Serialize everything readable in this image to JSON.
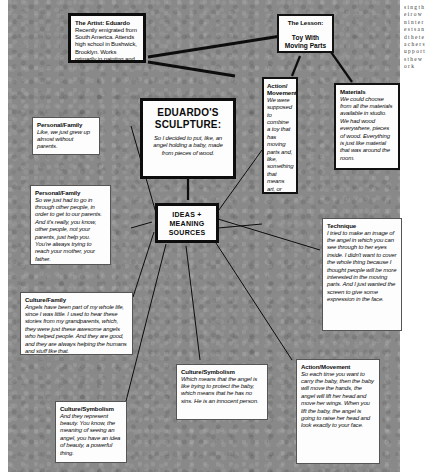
{
  "poster": {
    "background_color": "#898989",
    "node_fill": "#fdfdfd",
    "ink_color": "#0b0b0b"
  },
  "nodes": {
    "artist": {
      "header": "The Artist: Eduardo",
      "body": "Recently emigrated from South America. Attends high school in Bushwick, Brooklyn. Works primarily in painting and drawing, and much of his work is published in the student literary magazine."
    },
    "lesson": {
      "header": "The Lesson:",
      "subtitle": "Toy With Moving Parts"
    },
    "sculpture": {
      "title": "EDUARDO'S SCULPTURE:",
      "body": "So I decided to put, like, an angel holding a baby, made from pieces of wood."
    },
    "ideas": {
      "title": "IDEAS + MEANING SOURCES"
    },
    "action_top": {
      "header": "Action/ Movement",
      "body": "We were supposed to combine a toy that has moving parts and, like, something that means art, or means something to you."
    },
    "materials": {
      "header": "Materials",
      "body": "We could choose from all the materials available in studio. We had wood everywhere, pieces of wood. Everything is just like material that was around the room."
    },
    "technique": {
      "header": "Technique",
      "body": "I tried to make an image of the angel in which you can see through to her eyes inside. I didn't want to cover the whole thing because I thought people will be more interested in the moving parts. And I just wanted the screen to give some expression in the face."
    },
    "personal_family_1": {
      "header": "Personal/Family",
      "body": "Like, we just grew up almost without parents."
    },
    "personal_family_2": {
      "header": "Personal/Family",
      "body": "So we just had to go in through other people, in order to get to our parents. And it's really, you know, other people, not your parents, just help you. You're always trying to reach your mother, your father."
    },
    "culture_family": {
      "header": "Culture/Family",
      "body": "Angels have been part of my whole life, since I was little. I used to hear these stories from my grandparents, which, they were just these awesome angels who helped people. And they are good, and they are always helping the humans and stuff like that."
    },
    "culture_symbolism_left": {
      "header": "Culture/Symbolism",
      "body": "And they represent beauty. You know, the meaning of seeing an angel, you have an idea of beauty, a powerful thing."
    },
    "culture_symbolism_mid": {
      "header": "Culture/Symbolism",
      "body": "Which means that the angel is like trying to protect the baby, which means that he has no sins. He is an innocent person."
    },
    "action_movement_bottom": {
      "header": "Action/Movement",
      "body": "So each time you want to carry the baby, then the baby will move the hands, the angel will lift her head and move her wings. When you lift the baby, the angel is going to raise her head and look exactly to your face."
    }
  },
  "page_margin_text": "s i n g t h e i r o w n i n t e r e s t s a n d t h e t e a c h e r s u p p o r t s t h e w o r k"
}
